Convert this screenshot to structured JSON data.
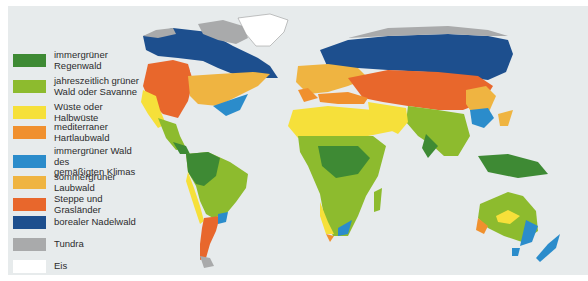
{
  "colors": {
    "ocean": "#e7ebec",
    "rainforest": "#3e8a34",
    "savanna": "#8dbb2e",
    "desert": "#f6e03a",
    "mediterranean": "#f0902e",
    "temperate_evergreen": "#2b8ccb",
    "deciduous": "#efb441",
    "steppe": "#e8672c",
    "boreal": "#1d4f8e",
    "tundra": "#a9aaab",
    "ice": "#ffffff"
  },
  "legend": {
    "items": [
      {
        "id": "rainforest",
        "label": "immergrüner Regenwald",
        "line1": "immergrüner",
        "line2": "Regenwald",
        "color": "#3e8a34"
      },
      {
        "id": "savanna",
        "label": "jahreszeitlich grüner Wald oder Savanne",
        "line1": "jahreszeitlich grüner",
        "line2": "Wald oder Savanne",
        "color": "#8dbb2e"
      },
      {
        "id": "desert",
        "label": "Wüste oder Halbwüste",
        "line1": "Wüste oder Halbwüste",
        "line2": "",
        "color": "#f6e03a"
      },
      {
        "id": "mediterranean",
        "label": "mediterraner Hartlaubwald",
        "line1": "mediterraner",
        "line2": "Hartlaubwald",
        "color": "#f0902e"
      },
      {
        "id": "temperate_evergreen",
        "label": "immergrüner Wald des gemäßigten Klimas",
        "line1": "immergrüner Wald des",
        "line2": "gemäßigten Klimas",
        "color": "#2b8ccb"
      },
      {
        "id": "deciduous",
        "label": "sommergrüner Laubwald",
        "line1": "sommergrüner Laubwald",
        "line2": "",
        "color": "#efb441"
      },
      {
        "id": "steppe",
        "label": "Steppe und Grasländer",
        "line1": "Steppe und Grasländer",
        "line2": "",
        "color": "#e8672c"
      },
      {
        "id": "boreal",
        "label": "borealer Nadelwald",
        "line1": "borealer Nadelwald",
        "line2": "",
        "color": "#1d4f8e"
      },
      {
        "id": "tundra",
        "label": "Tundra",
        "line1": "Tundra",
        "line2": "",
        "color": "#a9aaab"
      },
      {
        "id": "ice",
        "label": "Eis",
        "line1": "Eis",
        "line2": "",
        "color": "#ffffff"
      }
    ]
  }
}
